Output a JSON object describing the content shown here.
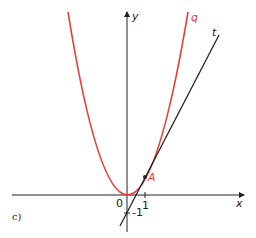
{
  "figure": {
    "panel_label": "c)",
    "axes": {
      "x_label": "x",
      "y_label": "y",
      "origin_label": "0",
      "tick_x": "1",
      "tick_y": "-1"
    },
    "curves": [
      {
        "name": "q",
        "label": "q",
        "equation": "y = x^2",
        "color": "#e8403a"
      },
      {
        "name": "t",
        "label": "t",
        "equation": "y = 2x - 1",
        "color": "#222222"
      }
    ],
    "points": [
      {
        "label": "A",
        "x": 1,
        "y": 1,
        "color": "#e8403a"
      }
    ]
  }
}
